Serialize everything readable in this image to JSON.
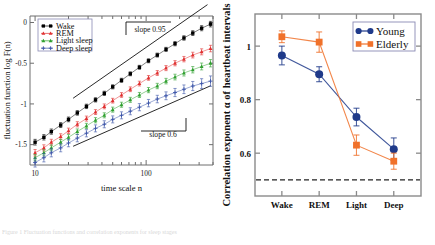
{
  "figure": {
    "caption": "Figure 1  Fluctuation functions and correlation exponents for sleep stages"
  },
  "chart_data": [
    {
      "type": "line",
      "title": "",
      "panel": "left",
      "xlabel": "time scale  n",
      "ylabel": "fluctuation function log F(n)",
      "xscale": "log",
      "xlim": [
        9,
        400
      ],
      "ylim": [
        -1.75,
        0.08
      ],
      "xticks": [
        10,
        100
      ],
      "xticklabels": [
        "10",
        "100"
      ],
      "yticks": [
        0,
        -0.5,
        -1,
        -1.5
      ],
      "yticklabels": [
        "0",
        "-0.5",
        "-1",
        "-1.5"
      ],
      "grid": false,
      "legend_position": "upper-left",
      "annotations": [
        {
          "text": "slope 0.95",
          "slope": 0.95
        },
        {
          "text": "slope 0.6",
          "slope": 0.6
        }
      ],
      "series": [
        {
          "name": "Wake",
          "color": "#000000",
          "marker": "square",
          "x": [
            10,
            12,
            14,
            17,
            20,
            24,
            29,
            35,
            42,
            50,
            60,
            72,
            87,
            105,
            126,
            151,
            182,
            219,
            263,
            316,
            380
          ],
          "y": [
            -1.47,
            -1.41,
            -1.34,
            -1.26,
            -1.19,
            -1.11,
            -1.03,
            -0.95,
            -0.87,
            -0.79,
            -0.71,
            -0.63,
            -0.55,
            -0.47,
            -0.4,
            -0.33,
            -0.26,
            -0.19,
            -0.13,
            -0.07,
            -0.02
          ],
          "yerr": [
            0.035,
            0.033,
            0.032,
            0.03,
            0.029,
            0.028,
            0.027,
            0.026,
            0.026,
            0.025,
            0.025,
            0.024,
            0.024,
            0.024,
            0.024,
            0.025,
            0.026,
            0.027,
            0.029,
            0.031,
            0.034
          ]
        },
        {
          "name": "REM",
          "color": "#e03030",
          "marker": "triangle",
          "x": [
            10,
            12,
            14,
            17,
            20,
            24,
            29,
            35,
            42,
            50,
            60,
            72,
            87,
            105,
            126,
            151,
            182,
            219,
            263,
            316,
            380
          ],
          "y": [
            -1.6,
            -1.54,
            -1.47,
            -1.4,
            -1.33,
            -1.25,
            -1.18,
            -1.1,
            -1.03,
            -0.96,
            -0.89,
            -0.82,
            -0.75,
            -0.68,
            -0.62,
            -0.56,
            -0.5,
            -0.45,
            -0.4,
            -0.36,
            -0.32
          ],
          "yerr": [
            0.04,
            0.038,
            0.036,
            0.034,
            0.033,
            0.032,
            0.031,
            0.03,
            0.03,
            0.029,
            0.029,
            0.029,
            0.029,
            0.029,
            0.03,
            0.031,
            0.032,
            0.033,
            0.035,
            0.037,
            0.04
          ]
        },
        {
          "name": "Light sleep",
          "color": "#2fa02f",
          "marker": "triangle",
          "x": [
            10,
            12,
            14,
            17,
            20,
            24,
            29,
            35,
            42,
            50,
            60,
            72,
            87,
            105,
            126,
            151,
            182,
            219,
            263,
            316,
            380
          ],
          "y": [
            -1.66,
            -1.6,
            -1.54,
            -1.47,
            -1.41,
            -1.34,
            -1.27,
            -1.2,
            -1.14,
            -1.07,
            -1.01,
            -0.95,
            -0.89,
            -0.83,
            -0.78,
            -0.72,
            -0.67,
            -0.62,
            -0.58,
            -0.54,
            -0.5
          ],
          "yerr": [
            0.04,
            0.038,
            0.036,
            0.035,
            0.034,
            0.033,
            0.032,
            0.032,
            0.031,
            0.031,
            0.031,
            0.031,
            0.031,
            0.032,
            0.033,
            0.034,
            0.035,
            0.037,
            0.039,
            0.042,
            0.045
          ]
        },
        {
          "name": "Deep sleep",
          "color": "#3b54a8",
          "marker": "plus",
          "x": [
            10,
            12,
            14,
            17,
            20,
            24,
            29,
            35,
            42,
            50,
            60,
            72,
            87,
            105,
            126,
            151,
            182,
            219,
            263,
            316,
            380
          ],
          "y": [
            -1.72,
            -1.66,
            -1.6,
            -1.54,
            -1.48,
            -1.42,
            -1.36,
            -1.3,
            -1.25,
            -1.19,
            -1.14,
            -1.09,
            -1.04,
            -0.99,
            -0.94,
            -0.9,
            -0.86,
            -0.82,
            -0.78,
            -0.75,
            -0.72
          ],
          "yerr": [
            0.055,
            0.052,
            0.05,
            0.048,
            0.046,
            0.045,
            0.044,
            0.043,
            0.043,
            0.043,
            0.043,
            0.043,
            0.044,
            0.045,
            0.046,
            0.048,
            0.05,
            0.053,
            0.056,
            0.06,
            0.064
          ]
        }
      ]
    },
    {
      "type": "line",
      "panel": "right",
      "title": "",
      "xlabel": "",
      "ylabel": "Correlation exponent α of heartbeat intervals",
      "categories": [
        "Wake",
        "REM",
        "Light",
        "Deep"
      ],
      "ylim": [
        0.44,
        1.12
      ],
      "yticks": [
        1,
        0.8,
        0.6
      ],
      "yticklabels": [
        "1",
        "0.8",
        "0.6"
      ],
      "grid": false,
      "legend_position": "upper-right",
      "refline": {
        "value": 0.5,
        "style": "dashed"
      },
      "series": [
        {
          "name": "Young",
          "color": "#1f3a8a",
          "marker": "circle",
          "values": [
            0.965,
            0.895,
            0.735,
            0.615
          ],
          "yerr": [
            0.035,
            0.028,
            0.033,
            0.042
          ]
        },
        {
          "name": "Elderly",
          "color": "#f0712a",
          "marker": "square",
          "values": [
            1.035,
            1.015,
            0.63,
            0.57
          ],
          "yerr": [
            0.022,
            0.038,
            0.038,
            0.03
          ]
        }
      ]
    }
  ]
}
